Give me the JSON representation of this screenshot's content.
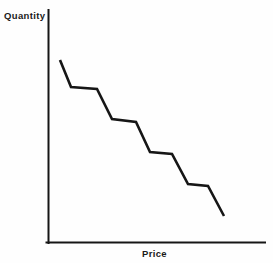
{
  "figure": {
    "background_color": "#fefefe",
    "ink_color": "#161616",
    "width": 273,
    "height": 263
  },
  "axes": {
    "y_label": "Quantity",
    "x_label": "Price",
    "axis_line_color": "#161616",
    "axis_line_width": 2,
    "origin": {
      "x": 48,
      "y": 243
    },
    "y_axis_top": {
      "x": 48,
      "y": 10
    },
    "x_axis_right": {
      "x": 265,
      "y": 243
    }
  },
  "curve": {
    "name": "demand-step-curve",
    "color": "#161616",
    "line_width": 2.6,
    "points": [
      {
        "x": 60,
        "y": 60
      },
      {
        "x": 71,
        "y": 87
      },
      {
        "x": 97,
        "y": 89
      },
      {
        "x": 112,
        "y": 119
      },
      {
        "x": 136,
        "y": 122
      },
      {
        "x": 150,
        "y": 152
      },
      {
        "x": 172,
        "y": 154
      },
      {
        "x": 188,
        "y": 184
      },
      {
        "x": 208,
        "y": 186
      },
      {
        "x": 224,
        "y": 216
      }
    ]
  },
  "chart_data": {
    "type": "line",
    "title": "",
    "subtitle": "",
    "xlabel": "Price",
    "ylabel": "Quantity",
    "grid": false,
    "legend": false,
    "legend_position": "none",
    "axis_ticks": false,
    "tick_labels": {
      "x": [],
      "y": []
    },
    "xlim": [
      0,
      10
    ],
    "ylim": [
      0,
      10
    ],
    "series": [
      {
        "name": "Quantity demanded",
        "style": "step-descending",
        "x": [
          0.55,
          1.05,
          2.25,
          2.95,
          4.05,
          4.7,
          5.7,
          6.45,
          7.35,
          8.1
        ],
        "y": [
          8.0,
          6.8,
          6.7,
          5.4,
          5.3,
          4.0,
          3.9,
          2.6,
          2.5,
          1.2
        ]
      }
    ],
    "plateaus": [
      {
        "index": 1,
        "x_start": 1.05,
        "x_end": 2.25,
        "y": 6.75
      },
      {
        "index": 2,
        "x_start": 2.95,
        "x_end": 4.05,
        "y": 5.35
      },
      {
        "index": 3,
        "x_start": 4.7,
        "x_end": 5.7,
        "y": 3.95
      },
      {
        "index": 4,
        "x_start": 6.45,
        "x_end": 7.35,
        "y": 2.55
      }
    ]
  }
}
